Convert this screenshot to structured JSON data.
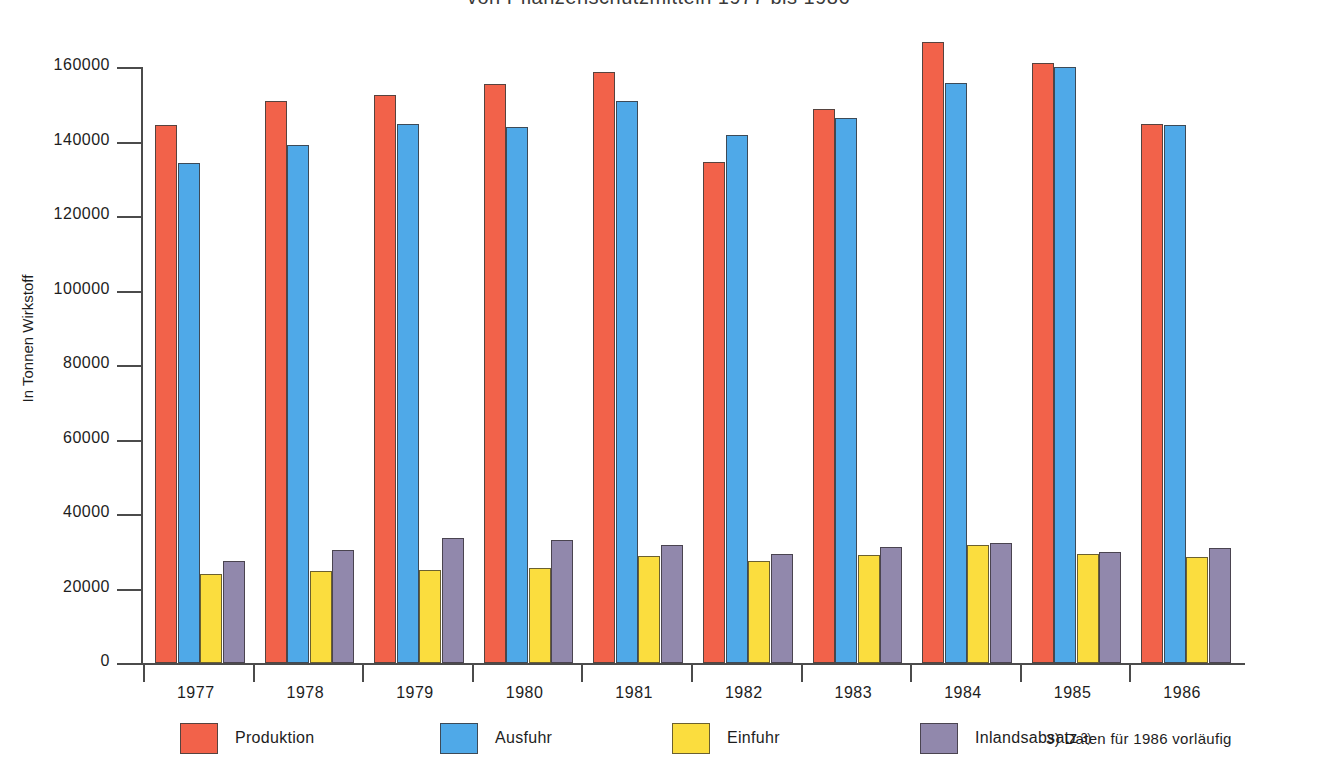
{
  "chart_data": {
    "type": "bar",
    "title": "von Pflanzenschutzmitteln 1977 bis 1986",
    "xlabel": "",
    "ylabel": "In Tonnen Wirkstoff",
    "ylim": [
      0,
      160000
    ],
    "ytick_labels": [
      "160000",
      "140000",
      "120000",
      "100000",
      "80000",
      "60000",
      "40000",
      "20000",
      "0"
    ],
    "ytick_values": [
      160000,
      140000,
      120000,
      100000,
      80000,
      60000,
      40000,
      20000,
      0
    ],
    "grid": false,
    "legend_position": "bottom",
    "categories": [
      "1977",
      "1978",
      "1979",
      "1980",
      "1981",
      "1982",
      "1983",
      "1984",
      "1985",
      "1986"
    ],
    "series": [
      {
        "name": "Produktion",
        "color": "#f2624a",
        "values": [
          144300,
          151000,
          152400,
          155400,
          158700,
          134500,
          148800,
          166700,
          161200,
          144800
        ]
      },
      {
        "name": "Ausfuhr",
        "color": "#4fa9e8",
        "values": [
          134300,
          139100,
          144800,
          143900,
          150800,
          141800,
          146200,
          155700,
          160000,
          144400
        ]
      },
      {
        "name": "Einfuhr",
        "color": "#fbdd3e",
        "values": [
          23900,
          24700,
          24900,
          25600,
          28700,
          27300,
          29000,
          31700,
          29200,
          28500
        ]
      },
      {
        "name": "Inlandsabsatz",
        "color": "#9188ac",
        "values": [
          27500,
          30400,
          33600,
          32900,
          31700,
          29300,
          31200,
          32200,
          29800,
          31000
        ]
      }
    ],
    "annotations": {
      "inlandsabsatz_superscript": "3)",
      "footnote": "3) Daten für 1986 vorläufig"
    }
  },
  "legend": {
    "items": [
      {
        "label": "Produktion",
        "key": "produktion"
      },
      {
        "label": "Ausfuhr",
        "key": "ausfuhr"
      },
      {
        "label": "Einfuhr",
        "key": "einfuhr"
      },
      {
        "label": "Inlandsabsatz",
        "key": "inlands"
      }
    ]
  }
}
